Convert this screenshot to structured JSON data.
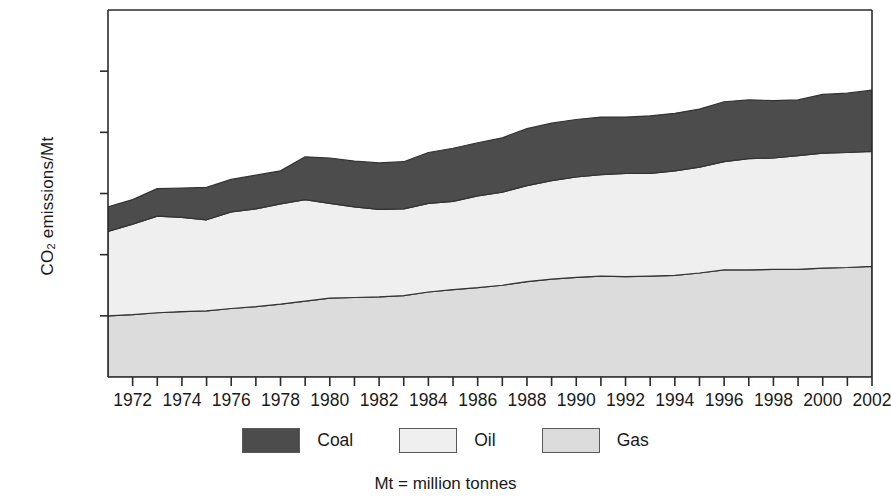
{
  "chart_data": {
    "type": "area",
    "stacked": true,
    "title": "",
    "xlabel": "",
    "ylabel": "CO2 emissions/Mt",
    "ylabel_display": "CO₂ emissions/Mt",
    "caption": "Mt = million tonnes",
    "xlim": [
      1971,
      2002
    ],
    "ylim": [
      0,
      30000
    ],
    "ytick_values": [
      0,
      5000,
      10000,
      15000,
      20000,
      25000,
      30000
    ],
    "ytick_labels": [
      "0",
      "5000",
      "10000",
      "15000",
      "20000",
      "25000",
      "30000"
    ],
    "xtick_values": [
      1972,
      1974,
      1976,
      1978,
      1980,
      1982,
      1984,
      1986,
      1988,
      1990,
      1992,
      1994,
      1996,
      1998,
      2000,
      2002
    ],
    "xtick_labels": [
      "1972",
      "1974",
      "1976",
      "1978",
      "1980",
      "1982",
      "1984",
      "1986",
      "1988",
      "1990",
      "1992",
      "1994",
      "1996",
      "1998",
      "2000",
      "2002"
    ],
    "minor_xticks_every": 1,
    "grid": false,
    "legend_position": "bottom",
    "x": [
      1971,
      1972,
      1973,
      1974,
      1975,
      1976,
      1977,
      1978,
      1979,
      1980,
      1981,
      1982,
      1983,
      1984,
      1985,
      1986,
      1987,
      1988,
      1989,
      1990,
      1991,
      1992,
      1993,
      1994,
      1995,
      1996,
      1997,
      1998,
      1999,
      2000,
      2001,
      2002
    ],
    "series": [
      {
        "name": "Gas",
        "color": "#dcdcdc",
        "stack_order": 1,
        "values": [
          5000,
          5100,
          5250,
          5350,
          5400,
          5600,
          5750,
          5950,
          6200,
          6450,
          6500,
          6550,
          6650,
          6950,
          7150,
          7300,
          7500,
          7800,
          8000,
          8150,
          8250,
          8200,
          8250,
          8300,
          8500,
          8750,
          8750,
          8800,
          8800,
          8900,
          8950,
          9050
        ]
      },
      {
        "name": "Oil",
        "color": "#efefef",
        "stack_order": 2,
        "values": [
          6900,
          7400,
          7900,
          7700,
          7450,
          7900,
          8000,
          8200,
          8300,
          7750,
          7400,
          7150,
          7100,
          7250,
          7200,
          7500,
          7600,
          7850,
          8050,
          8200,
          8300,
          8450,
          8400,
          8550,
          8650,
          8850,
          9100,
          9100,
          9300,
          9400,
          9400,
          9400
        ]
      },
      {
        "name": "Coal",
        "color": "#4c4c4c",
        "stack_order": 3,
        "values": [
          2000,
          2000,
          2250,
          2400,
          2650,
          2650,
          2750,
          2700,
          3500,
          3700,
          3750,
          3800,
          3850,
          4150,
          4350,
          4350,
          4450,
          4650,
          4700,
          4700,
          4700,
          4600,
          4700,
          4700,
          4750,
          4900,
          4800,
          4700,
          4550,
          4800,
          4850,
          5000
        ]
      }
    ],
    "totals": [
      13900,
      14500,
      15400,
      15450,
      15500,
      16150,
      16500,
      16850,
      18000,
      17900,
      17650,
      17500,
      17600,
      18350,
      18700,
      19150,
      19550,
      20300,
      20750,
      21050,
      21250,
      21250,
      21350,
      21550,
      21900,
      22500,
      22650,
      22600,
      22650,
      23100,
      23200,
      23450
    ],
    "legend": [
      {
        "label": "Coal",
        "color": "#4c4c4c"
      },
      {
        "label": "Oil",
        "color": "#efefef"
      },
      {
        "label": "Gas",
        "color": "#dcdcdc"
      }
    ],
    "axis_color": "#2b2b2b",
    "line_color": "#333333",
    "background": "#ffffff"
  }
}
